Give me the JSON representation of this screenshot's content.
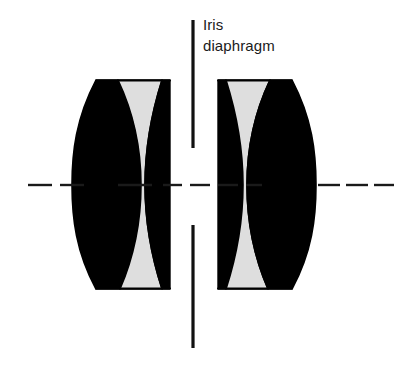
{
  "figure": {
    "type": "optical-diagram",
    "width": 398,
    "height": 368,
    "background_color": "#ffffff"
  },
  "annotation": {
    "label_line_1": "Iris",
    "label_line_2": "diaphragm",
    "text_color": "#1a1a1a",
    "font_size_px": 15
  },
  "colors": {
    "glass_dark": "#000000",
    "glass_light": "#dedede",
    "outline": "#000000",
    "axis": "#1a1a1a",
    "diaphragm": "#111111"
  },
  "optical_axis": {
    "name": "optical-axis",
    "orientation": "horizontal",
    "y": 185,
    "style": "dashed",
    "stroke_width": 2.4,
    "segments": [
      [
        28,
        52
      ],
      [
        60,
        84
      ],
      [
        118,
        152
      ],
      [
        163,
        182
      ],
      [
        190,
        210
      ],
      [
        218,
        238
      ],
      [
        246,
        262
      ],
      [
        318,
        340
      ],
      [
        346,
        368
      ],
      [
        374,
        394
      ]
    ]
  },
  "iris_diaphragm": {
    "name": "iris-diaphragm",
    "x": 193,
    "stroke_width": 3.2,
    "upper_blade": {
      "y_start": 20,
      "y_end": 148
    },
    "lower_blade": {
      "y_start": 225,
      "y_end": 348
    },
    "aperture_height": 77
  },
  "lens_groups": [
    {
      "name": "left-doublet",
      "position": "left",
      "top_y": 80,
      "bottom_y": 289,
      "left_x": 72,
      "right_x": 170,
      "elements": [
        {
          "name": "left-crown-element",
          "tint": "dark",
          "shape": "meniscus"
        },
        {
          "name": "left-flint-element",
          "tint": "light",
          "shape": "biconcave"
        }
      ]
    },
    {
      "name": "right-doublet",
      "position": "right",
      "top_y": 80,
      "bottom_y": 289,
      "left_x": 216,
      "right_x": 318,
      "elements": [
        {
          "name": "right-flint-element",
          "tint": "light",
          "shape": "biconcave"
        },
        {
          "name": "right-crown-element",
          "tint": "dark",
          "shape": "meniscus"
        }
      ]
    }
  ]
}
